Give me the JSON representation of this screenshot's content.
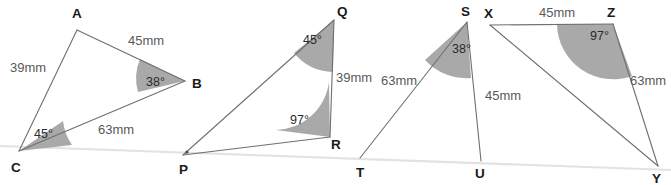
{
  "figure": {
    "width": 671,
    "height": 185,
    "background_color": "#ffffff",
    "edge_color": "#6f6f6f",
    "angle_fill_color": "#a9a9a9",
    "baseline_color": "#e2e2e2",
    "measure_text_color": "#595959",
    "vertex_text_color": "#1a1a1a"
  },
  "triangles": [
    {
      "id": "triangle-abc",
      "name": "ABC",
      "vertices": [
        {
          "label": "A",
          "x": 77,
          "y": 30,
          "label_x": 72,
          "label_y": 18
        },
        {
          "label": "B",
          "x": 185,
          "y": 81,
          "label_x": 192,
          "label_y": 88
        },
        {
          "label": "C",
          "x": 19,
          "y": 151,
          "label_x": 11,
          "label_y": 172
        }
      ],
      "sides": [
        {
          "label": "45mm",
          "value": 45,
          "unit": "mm",
          "between": "A-B",
          "x": 128,
          "y": 45
        },
        {
          "label": "39mm",
          "value": 39,
          "unit": "mm",
          "between": "A-C",
          "x": 10,
          "y": 72
        },
        {
          "label": "63mm",
          "value": 63,
          "unit": "mm",
          "between": "C-B",
          "x": 98,
          "y": 134
        }
      ],
      "angles": [
        {
          "label": "38°",
          "value": 38,
          "at": "B",
          "x": 146,
          "y": 86
        },
        {
          "label": "45°",
          "value": 45,
          "at": "C",
          "x": 34,
          "y": 138
        }
      ]
    },
    {
      "id": "triangle-pqr",
      "name": "PQR",
      "vertices": [
        {
          "label": "Q",
          "x": 334,
          "y": 20,
          "label_x": 337,
          "label_y": 16
        },
        {
          "label": "R",
          "x": 330,
          "y": 137,
          "label_x": 331,
          "label_y": 149
        },
        {
          "label": "P",
          "x": 183,
          "y": 155,
          "label_x": 179,
          "label_y": 174
        }
      ],
      "sides": [
        {
          "label": "39mm",
          "value": 39,
          "unit": "mm",
          "between": "Q-R",
          "x": 336,
          "y": 82
        }
      ],
      "angles": [
        {
          "label": "45°",
          "value": 45,
          "at": "Q",
          "x": 303,
          "y": 44
        },
        {
          "label": "97°",
          "value": 97,
          "at": "R",
          "x": 290,
          "y": 124
        }
      ]
    },
    {
      "id": "triangle-stu",
      "name": "STU",
      "vertices": [
        {
          "label": "S",
          "x": 467,
          "y": 22,
          "label_x": 461,
          "label_y": 16
        },
        {
          "label": "T",
          "x": 360,
          "y": 158,
          "label_x": 356,
          "label_y": 177
        },
        {
          "label": "U",
          "x": 481,
          "y": 161,
          "label_x": 475,
          "label_y": 178
        }
      ],
      "sides": [
        {
          "label": "63mm",
          "value": 63,
          "unit": "mm",
          "between": "S-T",
          "x": 381,
          "y": 85
        },
        {
          "label": "45mm",
          "value": 45,
          "unit": "mm",
          "between": "S-U",
          "x": 485,
          "y": 100
        }
      ],
      "angles": [
        {
          "label": "38°",
          "value": 38,
          "at": "S",
          "x": 452,
          "y": 53
        }
      ]
    },
    {
      "id": "triangle-xyz",
      "name": "XYZ",
      "vertices": [
        {
          "label": "X",
          "x": 490,
          "y": 25,
          "label_x": 484,
          "label_y": 18
        },
        {
          "label": "Z",
          "x": 613,
          "y": 24,
          "label_x": 607,
          "label_y": 17
        },
        {
          "label": "Y",
          "x": 658,
          "y": 166,
          "label_x": 652,
          "label_y": 183
        }
      ],
      "sides": [
        {
          "label": "45mm",
          "value": 45,
          "unit": "mm",
          "between": "X-Z",
          "x": 539,
          "y": 17
        },
        {
          "label": "63mm",
          "value": 63,
          "unit": "mm",
          "between": "Z-Y",
          "x": 630,
          "y": 85
        }
      ],
      "angles": [
        {
          "label": "97°",
          "value": 97,
          "at": "Z",
          "x": 590,
          "y": 40
        }
      ]
    }
  ]
}
